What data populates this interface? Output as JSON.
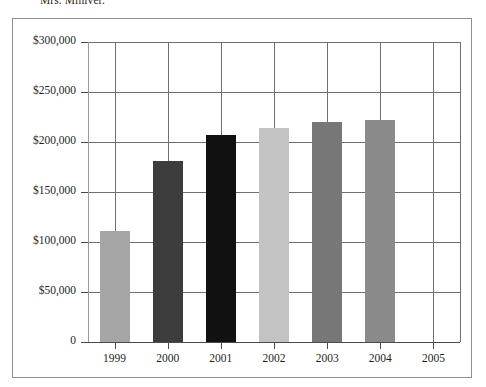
{
  "caption": {
    "text": "Mrs. Miniver."
  },
  "chart_data": {
    "type": "bar",
    "title": "",
    "subtitle": "",
    "xlabel": "",
    "ylabel": "",
    "categories": [
      "1999",
      "2000",
      "2001",
      "2002",
      "2003",
      "2004",
      "2005"
    ],
    "values": [
      111000,
      181000,
      207000,
      214000,
      220000,
      222000,
      null
    ],
    "value_labels": [
      "$111,000",
      "$181,000",
      "$207,000",
      "$214,000",
      "$220,000",
      "$222,000",
      ""
    ],
    "bar_colors": [
      "#a5a5a5",
      "#3d3d3d",
      "#111111",
      "#c3c3c3",
      "#777777",
      "#8a8a8a",
      "transparent"
    ],
    "ylim": [
      0,
      300000
    ],
    "ytick_values": [
      0,
      50000,
      100000,
      150000,
      200000,
      250000,
      300000
    ],
    "ytick_labels": [
      "0",
      "$50,000",
      "$100,000",
      "$150,000",
      "$200,000",
      "$250,000",
      "$300,000"
    ],
    "grid": {
      "horizontal": true,
      "vertical": true,
      "color": "#6f6f6f"
    },
    "legend": {
      "visible": false,
      "position": "none"
    },
    "axis_color": "#4a4a4a",
    "plot_background": "#ffffff",
    "border_color": "#8e8e8e"
  }
}
